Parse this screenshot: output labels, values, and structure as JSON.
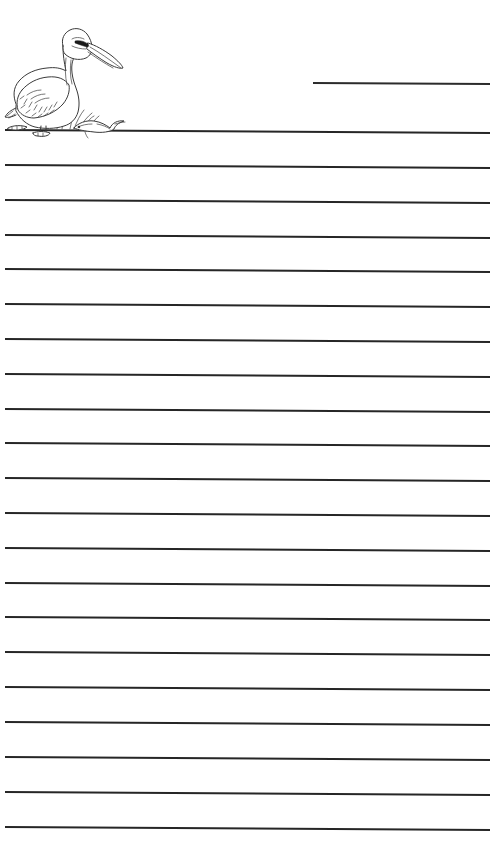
{
  "page": {
    "title": "Lined Writing Paper with Pelican",
    "background_color": "#ffffff",
    "width": 500,
    "height": 863,
    "kind": "printable-handwriting-paper"
  },
  "illustration": {
    "name": "pelican-illustration",
    "subject": "pelican",
    "description": "Black and white line drawing of a pelican standing on the first ruled line, with grass tufts and a small fish beside it",
    "style": "line-art-outline",
    "stroke_color": "#3a3a3a",
    "fill_color": "#ffffff",
    "parts": [
      "head",
      "long-bill",
      "eye",
      "neck",
      "body",
      "wing",
      "tail",
      "legs",
      "webbed-feet",
      "grass-tuft",
      "small-fish"
    ]
  },
  "name_line": {
    "name": "name-line",
    "label": "",
    "placeholder": "",
    "x_start": 313,
    "x_end": 490,
    "y": 83,
    "color": "#2b2b2b"
  },
  "ruled_lines": {
    "name": "ruled-lines",
    "count": 21,
    "color": "#262626",
    "thickness_px": 2,
    "spacing_px": 34.85,
    "first_line_y": 130,
    "last_line_y": 827,
    "x_start": 5,
    "x_end": 490,
    "tilt_px": 3,
    "y_positions": [
      130,
      165,
      200,
      235,
      269,
      304,
      339,
      374,
      409,
      443,
      478,
      513,
      548,
      583,
      617,
      652,
      687,
      722,
      757,
      792,
      827
    ]
  }
}
